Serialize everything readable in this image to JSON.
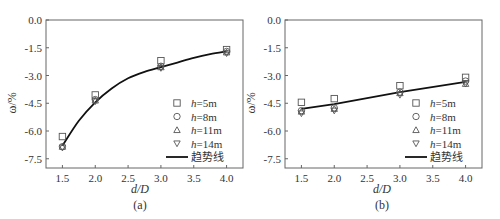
{
  "chart_data": [
    {
      "type": "scatter",
      "panel_label": "(a)",
      "title": "",
      "xlabel": "d/D",
      "ylabel": "ω/%",
      "xlim": [
        1.25,
        4.25
      ],
      "ylim": [
        -8.0,
        0.0
      ],
      "xticks": [
        1.5,
        2.0,
        2.5,
        3.0,
        3.5,
        4.0
      ],
      "xtick_labels": [
        "1.5",
        "2.0",
        "2.5",
        "3.0",
        "3.5",
        "4.0"
      ],
      "yticks": [
        0.0,
        -1.5,
        -3.0,
        -4.5,
        -6.0,
        -7.5
      ],
      "ytick_labels": [
        "0.0",
        "-1.5",
        "-3.0",
        "-4.5",
        "-6.0",
        "-7.5"
      ],
      "grid": false,
      "legend_position": "lower right",
      "x": [
        1.5,
        2.0,
        3.0,
        4.0
      ],
      "series": [
        {
          "name": "h=5m",
          "prefix": "h",
          "suffix": "=5m",
          "marker": "square",
          "values": [
            -6.3,
            -4.05,
            -2.2,
            -1.6
          ]
        },
        {
          "name": "h=8m",
          "prefix": "h",
          "suffix": "=8m",
          "marker": "circle",
          "values": [
            -6.85,
            -4.3,
            -2.5,
            -1.7
          ]
        },
        {
          "name": "h=11m",
          "prefix": "h",
          "suffix": "=11m",
          "marker": "triangle-up",
          "values": [
            -6.85,
            -4.35,
            -2.55,
            -1.75
          ]
        },
        {
          "name": "h=14m",
          "prefix": "h",
          "suffix": "=14m",
          "marker": "triangle-down",
          "values": [
            -6.9,
            -4.4,
            -2.6,
            -1.8
          ]
        }
      ],
      "trendline": {
        "name": "趋势线",
        "style": "smooth-curve",
        "x": [
          1.5,
          1.75,
          2.0,
          2.25,
          2.5,
          2.75,
          3.0,
          3.25,
          3.5,
          3.75,
          4.0
        ],
        "values": [
          -6.8,
          -5.45,
          -4.45,
          -3.7,
          -3.15,
          -2.8,
          -2.55,
          -2.3,
          -2.05,
          -1.85,
          -1.7
        ]
      }
    },
    {
      "type": "scatter",
      "panel_label": "(b)",
      "title": "",
      "xlabel": "d/D",
      "ylabel": "ω/%",
      "xlim": [
        1.25,
        4.25
      ],
      "ylim": [
        -8.0,
        0.0
      ],
      "xticks": [
        1.5,
        2.0,
        2.5,
        3.0,
        3.5,
        4.0
      ],
      "xtick_labels": [
        "1.5",
        "2.0",
        "2.5",
        "3.0",
        "3.5",
        "4.0"
      ],
      "yticks": [
        0.0,
        -1.5,
        -3.0,
        -4.5,
        -6.0,
        -7.5
      ],
      "ytick_labels": [
        "0.0",
        "-1.5",
        "-3.0",
        "-4.5",
        "-6.0",
        "-7.5"
      ],
      "grid": false,
      "legend_position": "lower right",
      "x": [
        1.5,
        2.0,
        3.0,
        4.0
      ],
      "series": [
        {
          "name": "h=5m",
          "prefix": "h",
          "suffix": "=5m",
          "marker": "square",
          "values": [
            -4.45,
            -4.25,
            -3.55,
            -3.1
          ]
        },
        {
          "name": "h=8m",
          "prefix": "h",
          "suffix": "=8m",
          "marker": "circle",
          "values": [
            -4.9,
            -4.75,
            -3.9,
            -3.3
          ]
        },
        {
          "name": "h=11m",
          "prefix": "h",
          "suffix": "=11m",
          "marker": "triangle-up",
          "values": [
            -4.95,
            -4.8,
            -3.95,
            -3.45
          ]
        },
        {
          "name": "h=14m",
          "prefix": "h",
          "suffix": "=14m",
          "marker": "triangle-down",
          "values": [
            -5.05,
            -4.9,
            -4.05,
            -3.45
          ]
        }
      ],
      "trendline": {
        "name": "趋势线",
        "style": "line",
        "x": [
          1.5,
          2.0,
          3.0,
          4.0
        ],
        "values": [
          -4.8,
          -4.55,
          -3.9,
          -3.35
        ]
      }
    }
  ]
}
